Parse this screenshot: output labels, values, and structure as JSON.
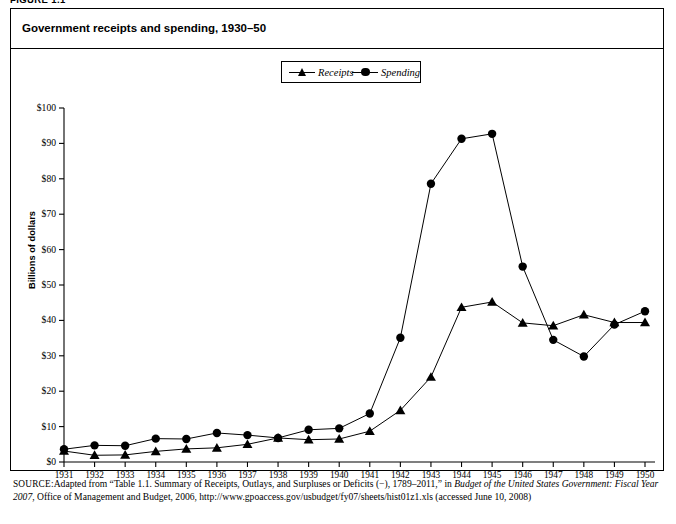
{
  "figure_label": "FIGURE 1.1",
  "figure_title": "Government receipts and spending, 1930–50",
  "legend": {
    "position": "top-center",
    "items": [
      {
        "label": "Receipts",
        "marker": "triangle-marker-icon"
      },
      {
        "label": "Spending",
        "marker": "circle-marker-icon"
      }
    ]
  },
  "axes": {
    "ylabel": "Billions of dollars",
    "xlabel": "",
    "yticks": [
      "$0",
      "$10",
      "$20",
      "$30",
      "$40",
      "$50",
      "$60",
      "$70",
      "$80",
      "$90",
      "$100"
    ],
    "xticks": [
      "1931",
      "1932",
      "1933",
      "1934",
      "1935",
      "1936",
      "1937",
      "1938",
      "1939",
      "1940",
      "1941",
      "1942",
      "1943",
      "1944",
      "1945",
      "1946",
      "1947",
      "1948",
      "1949",
      "1950"
    ]
  },
  "source": {
    "prefix": "SOURCE:",
    "text_1": "Adapted from “Table 1.1. Summary of Receipts, Outlays, and Surpluses or Deficits (−), 1789–2011,” in ",
    "italic_1": "Budget of the United States Government: Fiscal Year 2007",
    "text_2": ", Office of Management and Budget, 2006, http://www.gpoaccess.gov/usbudget/fy07/sheets/hist01z1.xls (accessed June 10, 2008)"
  },
  "colors": {
    "line": "#000000",
    "marker": "#000000",
    "background": "#ffffff",
    "border": "#000000"
  },
  "chart_data": {
    "type": "line",
    "title": "Government receipts and spending, 1930–50",
    "xlabel": "",
    "ylabel": "Billions of dollars",
    "xlim": [
      1931,
      1950
    ],
    "ylim": [
      0,
      100
    ],
    "grid": false,
    "legend_position": "top-center",
    "categories": [
      1931,
      1932,
      1933,
      1934,
      1935,
      1936,
      1937,
      1938,
      1939,
      1940,
      1941,
      1942,
      1943,
      1944,
      1945,
      1946,
      1947,
      1948,
      1949,
      1950
    ],
    "series": [
      {
        "name": "Receipts",
        "marker": "triangle",
        "values": [
          3.1,
          1.9,
          2.0,
          3.0,
          3.7,
          4.0,
          5.0,
          6.8,
          6.3,
          6.5,
          8.7,
          14.6,
          24.0,
          43.7,
          45.2,
          39.3,
          38.5,
          41.6,
          39.4,
          39.4
        ]
      },
      {
        "name": "Spending",
        "marker": "circle",
        "values": [
          3.6,
          4.7,
          4.6,
          6.6,
          6.5,
          8.2,
          7.6,
          6.8,
          9.1,
          9.5,
          13.7,
          35.1,
          78.6,
          91.3,
          92.7,
          55.2,
          34.5,
          29.8,
          38.8,
          42.6
        ]
      }
    ]
  }
}
